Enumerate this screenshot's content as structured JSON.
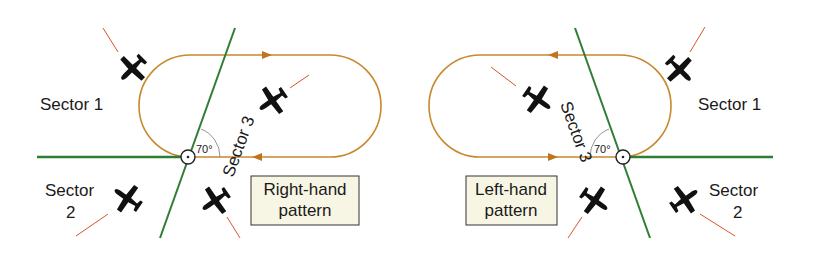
{
  "diagrams": [
    {
      "name": "right-hand-pattern",
      "box_label_line1": "Right-hand",
      "box_label_line2": "pattern",
      "sector1": "Sector 1",
      "sector2_line1": "Sector",
      "sector2_line2": "2",
      "sector3": "Sector 3",
      "angle": "70°"
    },
    {
      "name": "left-hand-pattern",
      "box_label_line1": "Left-hand",
      "box_label_line2": "pattern",
      "sector1": "Sector 1",
      "sector2_line1": "Sector",
      "sector2_line2": "2",
      "sector3": "Sector 3",
      "angle": "70°"
    }
  ],
  "colors": {
    "pattern": "#c8882e",
    "sector_line": "#2e7d32",
    "heading_line": "#d9542b",
    "box_fill": "#f7f6e4",
    "aircraft": "#111111"
  }
}
